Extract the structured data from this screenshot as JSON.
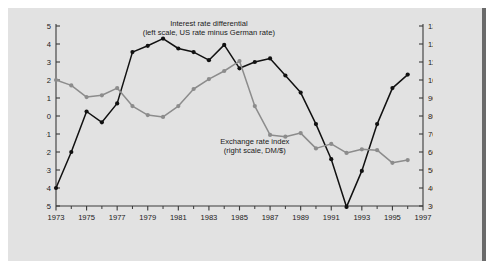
{
  "chart_data": {
    "type": "line",
    "title": "",
    "xlabel": "Year",
    "ylabel": "Percent",
    "y2label": "Index 1973 = 100",
    "xlim": [
      1973,
      1997
    ],
    "ylim": [
      -5,
      5
    ],
    "y2lim": [
      30,
      130
    ],
    "grid": false,
    "legend": "inline-annotations",
    "xticks": [
      1973,
      1975,
      1977,
      1979,
      1981,
      1983,
      1985,
      1987,
      1989,
      1991,
      1993,
      1995,
      1997
    ],
    "xticklabels": [
      "1973",
      "1975",
      "1977",
      "1979",
      "1981",
      "1983",
      "1985",
      "1987",
      "1989",
      "1991",
      "1993",
      "1995",
      "1997"
    ],
    "xticks_minor": [
      1974,
      1976,
      1978,
      1980,
      1982,
      1984,
      1986,
      1988,
      1990,
      1992,
      1994,
      1996
    ],
    "yticks": [
      -5,
      -4,
      -3,
      -2,
      -1,
      0,
      1,
      2,
      3,
      4,
      5
    ],
    "yticklabels": [
      "−5",
      "−4",
      "−3",
      "−2",
      "−1",
      "0",
      "1",
      "2",
      "3",
      "4",
      "5"
    ],
    "y2ticks": [
      30,
      40,
      50,
      60,
      70,
      80,
      90,
      100,
      110,
      120,
      130
    ],
    "y2ticklabels": [
      "30",
      "40",
      "50",
      "60",
      "70",
      "80",
      "90",
      "100",
      "110",
      "120",
      "130"
    ],
    "annotations": [
      {
        "name": "interest-rate-differential-label",
        "line1": "Interest rate differential",
        "line2": "(left scale, US rate minus German rate)",
        "x": 1983.0,
        "y": 5.0
      },
      {
        "name": "exchange-rate-index-label",
        "line1": "Exchange rate index",
        "line2": "(right scale, DM/$)",
        "x": 1986.0,
        "y": -1.55
      }
    ],
    "series": [
      {
        "name": "Interest rate differential",
        "color": "#111111",
        "axis": "left",
        "units": "percent",
        "x": [
          1973,
          1974,
          1975,
          1976,
          1977,
          1978,
          1979,
          1980,
          1981,
          1982,
          1983,
          1984,
          1985,
          1986,
          1987,
          1988,
          1989,
          1990,
          1991,
          1992,
          1993,
          1994,
          1995,
          1996
        ],
        "values": [
          -4.0,
          -2.0,
          0.25,
          -0.35,
          0.7,
          3.55,
          3.9,
          4.3,
          3.75,
          3.55,
          3.1,
          3.95,
          2.65,
          3.0,
          3.2,
          2.25,
          1.3,
          -0.45,
          -2.4,
          -5.05,
          -3.05,
          -0.45,
          1.55,
          2.3
        ]
      },
      {
        "name": "Exchange rate index",
        "color": "#8c8c8c",
        "axis": "right",
        "units": "index 1973 = 100",
        "x": [
          1973,
          1974,
          1975,
          1976,
          1977,
          1978,
          1979,
          1980,
          1981,
          1982,
          1983,
          1984,
          1985,
          1986,
          1987,
          1988,
          1989,
          1990,
          1991,
          1992,
          1993,
          1994,
          1995,
          1996
        ],
        "values": [
          100.0,
          97.0,
          90.5,
          91.5,
          95.5,
          85.5,
          80.5,
          79.5,
          85.5,
          95.0,
          100.5,
          105.0,
          110.5,
          85.5,
          69.5,
          68.5,
          70.5,
          62.0,
          64.5,
          59.5,
          61.5,
          61.0,
          54.0,
          55.5
        ]
      }
    ]
  }
}
